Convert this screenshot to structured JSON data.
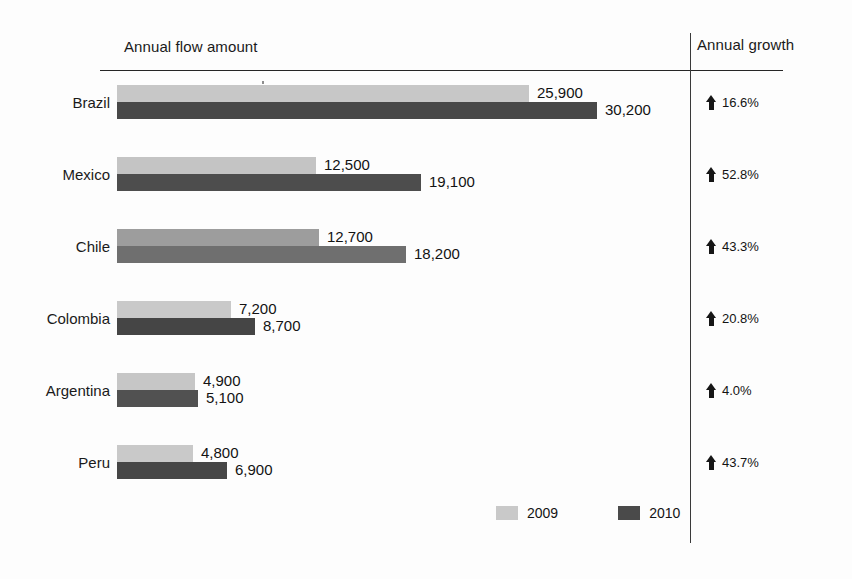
{
  "headers": {
    "flow": "Annual flow amount",
    "growth": "Annual growth"
  },
  "legend": [
    {
      "label": "2009",
      "color": "#c9c9c9",
      "icon": "legend-swatch-2009"
    },
    {
      "label": "2010",
      "color": "#4a4a4a",
      "icon": "legend-swatch-2010"
    }
  ],
  "growth_icon": "arrow-up-icon",
  "rows": [
    {
      "country": "Brazil",
      "v2009": "25,900",
      "v2010": "30,200",
      "growth": "16.6%",
      "color2009": "#c7c7c7",
      "color2010": "#484848"
    },
    {
      "country": "Mexico",
      "v2009": "12,500",
      "v2010": "19,100",
      "growth": "52.8%",
      "color2009": "#c4c4c4",
      "color2010": "#4d4d4d"
    },
    {
      "country": "Chile",
      "v2009": "12,700",
      "v2010": "18,200",
      "growth": "43.3%",
      "color2009": "#9d9d9d",
      "color2010": "#6f6f6f"
    },
    {
      "country": "Colombia",
      "v2009": "7,200",
      "v2010": "8,700",
      "growth": "20.8%",
      "color2009": "#c9c9c9",
      "color2010": "#454545"
    },
    {
      "country": "Argentina",
      "v2009": "4,900",
      "v2010": "5,100",
      "growth": "4.0%",
      "color2009": "#c6c6c6",
      "color2010": "#515151"
    },
    {
      "country": "Peru",
      "v2009": "4,800",
      "v2010": "6,900",
      "growth": "43.7%",
      "color2009": "#c9c9c9",
      "color2010": "#464646"
    }
  ],
  "chart_data": {
    "type": "bar",
    "title": "Annual flow amount",
    "orientation": "horizontal",
    "grouped": true,
    "categories": [
      "Brazil",
      "Mexico",
      "Chile",
      "Colombia",
      "Argentina",
      "Peru"
    ],
    "series": [
      {
        "name": "2009",
        "values": [
          25900,
          12500,
          12700,
          7200,
          4900,
          4800
        ],
        "color": "#c9c9c9"
      },
      {
        "name": "2010",
        "values": [
          30200,
          19100,
          18200,
          8700,
          5100,
          6900
        ],
        "color": "#4a4a4a"
      }
    ],
    "annotations": {
      "name": "Annual growth",
      "values": [
        "16.6%",
        "52.8%",
        "43.3%",
        "20.8%",
        "4.0%",
        "43.7%"
      ],
      "direction": [
        "up",
        "up",
        "up",
        "up",
        "up",
        "up"
      ]
    },
    "xlabel": "",
    "ylabel": "",
    "xlim": [
      0,
      30200
    ],
    "grid": false,
    "legend_position": "bottom"
  }
}
